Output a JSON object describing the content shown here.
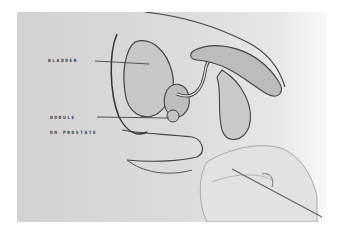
{
  "image": {
    "description": "Black-and-white photograph of an anatomical illustration of the male pelvic region (bladder, prostate, urethra), with a gloved hand holding a pointer toward the prostate",
    "colors": {
      "background": "#ffffff",
      "paper": "#d8d8d8",
      "ink": "#333333"
    }
  },
  "labels": {
    "bladder": "BLADDER",
    "nodule": "NODULE",
    "on_prostate": "ON PROSTATE"
  }
}
